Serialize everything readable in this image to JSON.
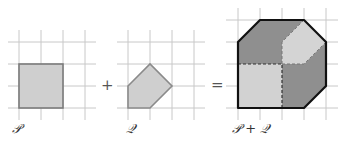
{
  "figure": {
    "panels": [
      {
        "id": "P",
        "label": "𝒫",
        "shape": "square",
        "vertices": [
          [
            0,
            2
          ],
          [
            2,
            2
          ],
          [
            2,
            0
          ],
          [
            0,
            0
          ]
        ]
      },
      {
        "id": "Q",
        "label": "𝒬",
        "shape": "pentagon",
        "vertices": [
          [
            0,
            1
          ],
          [
            1,
            2
          ],
          [
            2,
            1
          ],
          [
            1,
            0
          ],
          [
            0,
            0
          ]
        ]
      },
      {
        "id": "PQ",
        "label": "𝒫 + 𝒬",
        "shape": "octagon",
        "vertices": [
          [
            1,
            4
          ],
          [
            3,
            4
          ],
          [
            4,
            3
          ],
          [
            4,
            1
          ],
          [
            3,
            0
          ],
          [
            0,
            0
          ],
          [
            0,
            3
          ]
        ]
      }
    ],
    "operators": {
      "plus": "+",
      "equals": "="
    },
    "colors": {
      "fill_light": "#cfcfcf",
      "fill_mid": "#a9a9a9",
      "fill_dark": "#8f8f8f",
      "edge": "#7a7a7a",
      "sum_edge": "#111111",
      "grid": "#c8c8c8"
    }
  }
}
